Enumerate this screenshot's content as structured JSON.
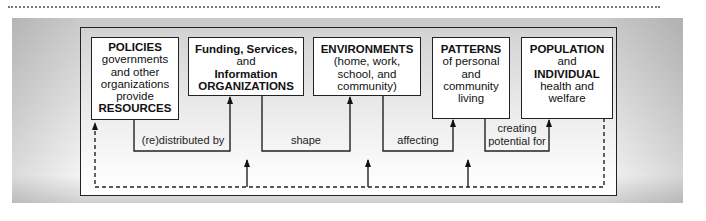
{
  "diagram": {
    "boxes": [
      {
        "id": "policies",
        "lines": [
          {
            "text": "POLICIES",
            "bold": true
          },
          {
            "text": "governments",
            "bold": false
          },
          {
            "text": "and other",
            "bold": false
          },
          {
            "text": "organizations",
            "bold": false
          },
          {
            "text": "provide",
            "bold": false
          },
          {
            "text": "RESOURCES",
            "bold": true
          }
        ]
      },
      {
        "id": "organizations",
        "lines": [
          {
            "text": "Funding, Services,",
            "bold": true
          },
          {
            "text": "and",
            "bold": false
          },
          {
            "text": "Information",
            "bold": true
          },
          {
            "text": "ORGANIZATIONS",
            "bold": true
          }
        ]
      },
      {
        "id": "environments",
        "lines": [
          {
            "text": "ENVIRONMENTS",
            "bold": true
          },
          {
            "text": "(home, work,",
            "bold": false
          },
          {
            "text": "school, and",
            "bold": false
          },
          {
            "text": "community)",
            "bold": false
          }
        ]
      },
      {
        "id": "patterns",
        "lines": [
          {
            "text": "PATTERNS",
            "bold": true
          },
          {
            "text": "of personal",
            "bold": false
          },
          {
            "text": "and",
            "bold": false
          },
          {
            "text": "community",
            "bold": false
          },
          {
            "text": "living",
            "bold": false
          }
        ]
      },
      {
        "id": "population",
        "lines": [
          {
            "text": "POPULATION",
            "bold": true
          },
          {
            "text": "and",
            "bold": false
          },
          {
            "text": "INDIVIDUAL",
            "bold": true
          },
          {
            "text": "health and",
            "bold": false
          },
          {
            "text": "welfare",
            "bold": false
          }
        ]
      }
    ],
    "connectors": [
      {
        "from": "policies",
        "to": "organizations",
        "label": "(re)distributed by"
      },
      {
        "from": "organizations",
        "to": "environments",
        "label": "shape"
      },
      {
        "from": "environments",
        "to": "patterns",
        "label": "affecting"
      },
      {
        "from": "patterns",
        "to": "population",
        "label_lines": [
          "creating",
          "potential for"
        ]
      }
    ],
    "feedback": {
      "style": "dashed",
      "from": "population",
      "to": "policies",
      "feeds_up_into": [
        "organizations-loop",
        "environments-loop",
        "patterns-loop"
      ]
    },
    "colors": {
      "line": "#222222",
      "box_fill": "#ffffff",
      "panel": "#d9d9d9"
    }
  }
}
